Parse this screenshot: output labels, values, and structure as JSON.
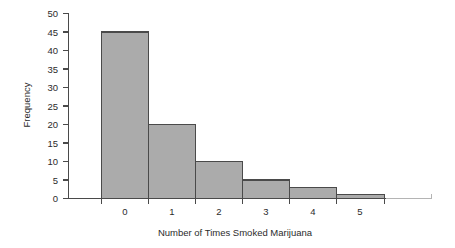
{
  "chart_data": {
    "type": "bar",
    "title": "",
    "subtitle": "",
    "categories": [
      "0",
      "1",
      "2",
      "3",
      "4",
      "5"
    ],
    "values": [
      45,
      20,
      10,
      5,
      3,
      1
    ],
    "series": [
      {
        "name": "Frequency",
        "values": [
          45,
          20,
          10,
          5,
          3,
          1
        ]
      }
    ],
    "xlabel": "Number of Times Smoked Marijuana",
    "ylabel": "Frequency",
    "ylim": [
      0,
      50
    ],
    "yticks": [
      0,
      5,
      10,
      15,
      20,
      25,
      30,
      35,
      40,
      45,
      50
    ],
    "ytick_labels": [
      "0",
      "5",
      "10",
      "15",
      "20",
      "25",
      "30",
      "35",
      "40",
      "45",
      "50"
    ],
    "xtick_labels": [
      "0",
      "1",
      "2",
      "3",
      "4",
      "5"
    ],
    "grid": false,
    "legend": false,
    "legend_position": "none",
    "bar_fill_color": "#ababab",
    "bar_edge_color": "#4a4a4a",
    "background_color": "#ffffff",
    "axis_color": "#4a4a4a",
    "text_color": "#2b2b2b",
    "annotations": []
  }
}
